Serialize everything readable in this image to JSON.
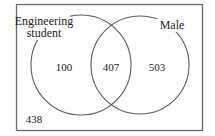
{
  "diagram": {
    "type": "venn",
    "sets": [
      {
        "id": "A",
        "label_lines": [
          "Engineering",
          "student"
        ]
      },
      {
        "id": "B",
        "label_lines": [
          "Male"
        ]
      }
    ],
    "regions": {
      "only_engineering_student": "100",
      "both": "407",
      "only_male": "503",
      "neither": "438"
    }
  }
}
